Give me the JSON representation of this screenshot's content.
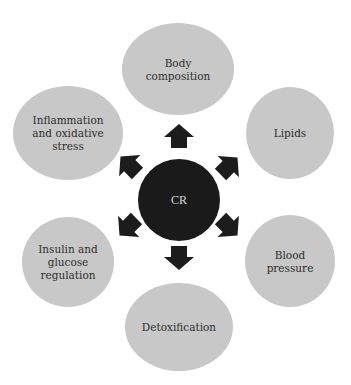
{
  "diagram": {
    "colors": {
      "background": "#ffffff",
      "outer_node_fill": "#c8c8c8",
      "center_node_fill": "#1a1a1a",
      "arrow_fill": "#1c1c1c",
      "text": "#2e2e2e",
      "center_text": "#d8d8d8"
    },
    "center": {
      "id": "cr",
      "label": "CR",
      "cx": 179,
      "cy": 200,
      "r": 41
    },
    "nodes": [
      {
        "id": "body-composition",
        "lines": [
          "Body",
          "composition"
        ],
        "cx": 178,
        "cy": 69,
        "rx": 56,
        "ry": 46
      },
      {
        "id": "lipids",
        "lines": [
          "Lipids"
        ],
        "cx": 290,
        "cy": 133,
        "rx": 44,
        "ry": 46
      },
      {
        "id": "blood-pressure",
        "lines": [
          "Blood",
          "pressure"
        ],
        "cx": 290,
        "cy": 261,
        "rx": 45,
        "ry": 46
      },
      {
        "id": "detoxification",
        "lines": [
          "Detoxification"
        ],
        "cx": 179,
        "cy": 327,
        "rx": 54,
        "ry": 44
      },
      {
        "id": "insulin-glucose-regulation",
        "lines": [
          "Insulin and",
          "glucose",
          "regulation"
        ],
        "cx": 68,
        "cy": 262,
        "rx": 46,
        "ry": 45
      },
      {
        "id": "inflammation-oxidative-stress",
        "lines": [
          "Inflammation",
          "and oxidative",
          "stress"
        ],
        "cx": 68,
        "cy": 133,
        "rx": 55,
        "ry": 47
      }
    ],
    "arrows": [
      {
        "id": "arrow-to-body-composition",
        "direction": "up",
        "cx": 179,
        "cy": 136,
        "angle": 0
      },
      {
        "id": "arrow-to-lipids",
        "direction": "up-right",
        "cx": 229,
        "cy": 166,
        "angle": 45
      },
      {
        "id": "arrow-to-blood-pressure",
        "direction": "down-right",
        "cx": 229,
        "cy": 227,
        "angle": 135
      },
      {
        "id": "arrow-to-detoxification",
        "direction": "down",
        "cx": 179,
        "cy": 258,
        "angle": 180
      },
      {
        "id": "arrow-to-insulin-glucose-regulation",
        "direction": "down-left",
        "cx": 128,
        "cy": 227,
        "angle": 225
      },
      {
        "id": "arrow-to-inflammation-oxidative-stress",
        "direction": "up-left",
        "cx": 129,
        "cy": 165,
        "angle": 315
      }
    ]
  }
}
